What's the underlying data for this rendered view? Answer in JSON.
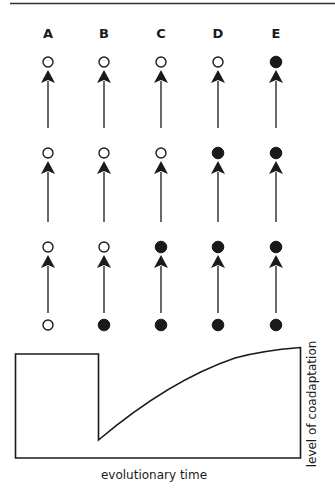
{
  "diagram": {
    "columns": [
      {
        "label": "A",
        "x": 48,
        "states": [
          "open",
          "open",
          "open",
          "open"
        ]
      },
      {
        "label": "B",
        "x": 104,
        "states": [
          "open",
          "open",
          "open",
          "filled"
        ]
      },
      {
        "label": "C",
        "x": 161,
        "states": [
          "open",
          "open",
          "filled",
          "filled"
        ]
      },
      {
        "label": "D",
        "x": 218,
        "states": [
          "open",
          "filled",
          "filled",
          "filled"
        ]
      },
      {
        "label": "E",
        "x": 276,
        "states": [
          "filled",
          "filled",
          "filled",
          "filled"
        ]
      }
    ],
    "row_y": [
      62,
      153,
      247,
      325
    ],
    "colors": {
      "stroke": "#1a1a1a",
      "fill": "#1a1a1a",
      "background": "#ffffff"
    }
  },
  "graph": {
    "xlabel": "evolutionary time",
    "ylabel": "level of coadaptation"
  },
  "chart_data": {
    "type": "line",
    "title": "",
    "xlabel": "evolutionary time",
    "ylabel": "level of coadaptation",
    "grid": false,
    "series": [
      {
        "name": "coadaptation",
        "points": [
          [
            0,
            1.0
          ],
          [
            0.29,
            1.0
          ],
          [
            0.29,
            0.18
          ],
          [
            0.39,
            0.4
          ],
          [
            0.52,
            0.63
          ],
          [
            0.65,
            0.85
          ],
          [
            0.77,
            0.97
          ],
          [
            1.0,
            1.07
          ]
        ]
      }
    ]
  }
}
